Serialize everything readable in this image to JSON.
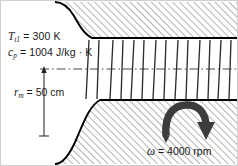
{
  "figure": {
    "name": "axial-compressor-annulus-diagram",
    "background_color": "#ffffff",
    "border_color": "#c8c8c8",
    "hatch_color": "#8a8a8a",
    "wall_color": "#000000",
    "blade_color": "#2a2a2a",
    "centerline_color": "#444444",
    "arrow_color": "#3a3a3a"
  },
  "labels": {
    "inlet": {
      "line1_symbol": "T",
      "line1_sub": "t1",
      "line1_value": " = 300 K",
      "line2_symbol": "c",
      "line2_sub": "p",
      "line2_value": " = 1004 J/kg · K",
      "line1_full": "Tt1 = 300 K",
      "line2_full": "cp = 1004 J/kg · K"
    },
    "radius": {
      "symbol": "r",
      "sub": "m",
      "value": " = 50 cm",
      "full": "rm = 50 cm"
    },
    "rotation": {
      "symbol": "ω",
      "value": " = 4000 rpm",
      "full": "ω = 4000 rpm"
    }
  },
  "icons": {
    "rotation_arrow": "curved-rotation-arrow-icon",
    "dimension_arrow": "dimension-arrow-icon"
  },
  "geometry": {
    "centerline_y": 69,
    "blade_stage_count": 8,
    "upper_wall_description": "hatched solid region above flow annulus with curved contraction at left",
    "lower_wall_description": "hatched solid region below flow annulus with curved contraction at left"
  }
}
